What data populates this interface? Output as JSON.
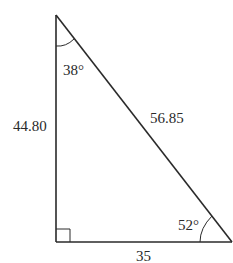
{
  "diagram": {
    "type": "right-triangle",
    "colors": {
      "stroke": "#2a2a2a",
      "text": "#2a2a2a",
      "background": "#ffffff"
    },
    "vertices": {
      "top": {
        "x": 55,
        "y": 15
      },
      "bottom_left": {
        "x": 56,
        "y": 242
      },
      "bottom_right": {
        "x": 232,
        "y": 242
      }
    },
    "sides": {
      "vertical": {
        "label": "44.80"
      },
      "hypotenuse": {
        "label": "56.85"
      },
      "base": {
        "label": "35"
      }
    },
    "angles": {
      "top": {
        "label": "38°"
      },
      "bottom_right": {
        "label": "52°"
      },
      "bottom_left": {
        "label": "right-angle"
      }
    }
  }
}
